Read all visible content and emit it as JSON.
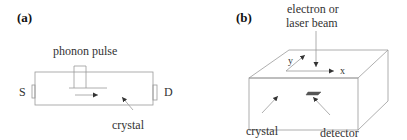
{
  "panel_a": {
    "label": "(a)",
    "pulse_label": "phonon pulse",
    "source_label": "S",
    "drain_label": "D",
    "crystal_label": "crystal"
  },
  "panel_b": {
    "label": "(b)",
    "beam_label_line1": "electron or",
    "beam_label_line2": "laser beam",
    "axis_x_label": "x",
    "axis_y_label": "y",
    "crystal_label": "crystal",
    "detector_label": "detector"
  },
  "colors": {
    "line": "#9a9a9a",
    "text": "#333333"
  }
}
